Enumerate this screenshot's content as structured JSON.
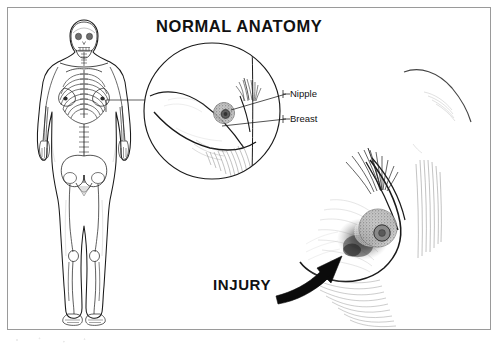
{
  "canvas": {
    "width": 499,
    "height": 348,
    "background_color": "#ffffff",
    "border_color": "#9a9a9a",
    "ink_color": "#111111"
  },
  "titles": {
    "normal_anatomy": "NORMAL ANATOMY",
    "injury": "INJURY"
  },
  "callout_labels": {
    "nipple": "Nipple",
    "breast": "Breast"
  },
  "panels": {
    "body_figure": {
      "name": "anterior full-body skeletal figure",
      "parts": [
        "skull",
        "clavicles",
        "ribcage",
        "sternum",
        "spine",
        "pelvis",
        "femur",
        "patella",
        "tibia",
        "fibula",
        "feet",
        "humerus",
        "radius",
        "ulna",
        "hands",
        "breast-outline",
        "nipple-marks"
      ]
    },
    "magnifier": {
      "name": "normal breast detail circle",
      "contents": [
        "breast-profile",
        "areola",
        "nipple",
        "axillary-hair",
        "shading-hatching"
      ]
    },
    "injury_view": {
      "name": "injured breast detail",
      "contents": [
        "breast-profile",
        "areola",
        "nipple",
        "contusion-bruise",
        "axillary-hair",
        "shading-hatching"
      ]
    },
    "upper_right_contour": {
      "name": "faint shoulder contour line"
    }
  },
  "annotations": {
    "arrow": {
      "name": "injury-arrow",
      "description": "thick curved arrow pointing up-right toward the bruise"
    },
    "leader_lines": [
      {
        "target": "nipple",
        "orientation": "horizontal"
      },
      {
        "target": "breast",
        "orientation": "horizontal"
      }
    ],
    "magnifier_connector": {
      "description": "thin line linking chest of body figure to detail circle"
    }
  }
}
